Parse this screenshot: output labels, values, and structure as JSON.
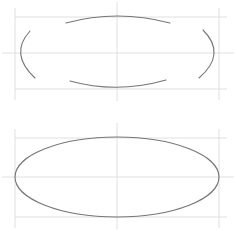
{
  "canvas": {
    "width": 236,
    "height": 231,
    "background": "#ffffff",
    "title": "Ellipse construction diagram"
  },
  "colors": {
    "stroke": "#767676",
    "guide": "#d8d8d8",
    "background": "#ffffff"
  },
  "strokes": {
    "curve_width": 1.1,
    "guide_width": 0.8
  },
  "figures": [
    {
      "id": "top-figure",
      "label": "Arc segments stage",
      "description": "Four separate freehand arc segments forming an incomplete ellipse inside its bounding box",
      "guide_box": {
        "left": 15,
        "top": 17,
        "right": 219,
        "bottom": 89
      },
      "center": {
        "x": 117,
        "y": 53
      },
      "ellipse": {
        "cx": 117,
        "cy": 53,
        "rx": 102,
        "ry": 36
      },
      "arcs": [
        {
          "id": "top-arc",
          "name": "top-arc-segment",
          "start": {
            "x": 66,
            "y": 23
          },
          "control": {
            "x": 117,
            "y": 9
          },
          "end": {
            "x": 170,
            "y": 23
          }
        },
        {
          "id": "bottom-arc",
          "name": "bottom-arc-segment",
          "start": {
            "x": 70,
            "y": 81
          },
          "control": {
            "x": 117,
            "y": 94
          },
          "end": {
            "x": 166,
            "y": 80
          }
        },
        {
          "id": "left-arc",
          "name": "left-arc-segment",
          "start": {
            "x": 30,
            "y": 31
          },
          "control": {
            "x": 9,
            "y": 54
          },
          "end": {
            "x": 35,
            "y": 78
          }
        },
        {
          "id": "right-arc",
          "name": "right-arc-segment",
          "start": {
            "x": 203,
            "y": 30
          },
          "control": {
            "x": 227,
            "y": 54
          },
          "end": {
            "x": 199,
            "y": 78
          }
        }
      ]
    },
    {
      "id": "bottom-figure",
      "label": "Completed ellipse stage",
      "description": "A single closed ellipse drawn within its bounding box guides",
      "guide_box": {
        "left": 15,
        "top": 138,
        "right": 219,
        "bottom": 217
      },
      "center": {
        "x": 117,
        "y": 177
      },
      "ellipse": {
        "cx": 117,
        "cy": 177,
        "rx": 102,
        "ry": 40
      }
    }
  ],
  "guides": {
    "horizontal_center_label": "horizontal centre line",
    "vertical_center_label": "vertical centre line",
    "box_label": "bounding box"
  }
}
